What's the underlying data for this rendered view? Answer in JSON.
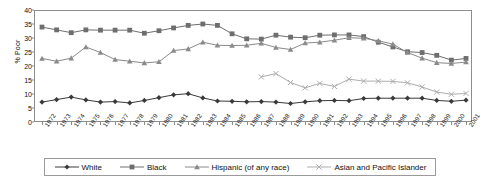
{
  "chart_data": {
    "type": "line",
    "title": "",
    "xlabel": "",
    "ylabel": "% Poor",
    "ylim": [
      0,
      40
    ],
    "ytick_values": [
      0,
      5,
      10,
      15,
      20,
      25,
      30,
      35,
      40
    ],
    "grid": false,
    "legend_position": "bottom",
    "categories": [
      "1972",
      "1973",
      "1974",
      "1975",
      "1976",
      "1977",
      "1978",
      "1979",
      "1980",
      "1981",
      "1982",
      "1983",
      "1984",
      "1985",
      "1986",
      "1987",
      "1988",
      "1989",
      "1990",
      "1991",
      "1992",
      "1993",
      "1994",
      "1995",
      "1996",
      "1997",
      "1998",
      "1999",
      "2000",
      "2001"
    ],
    "series": [
      {
        "name": "White",
        "marker": "diamond",
        "color": "#3a3a3a",
        "values": [
          7.1,
          8.0,
          8.9,
          7.9,
          7.1,
          7.3,
          6.8,
          7.7,
          8.7,
          9.7,
          10.1,
          8.6,
          7.5,
          7.4,
          7.2,
          7.3,
          7.1,
          6.6,
          7.2,
          7.6,
          7.7,
          7.6,
          8.4,
          8.5,
          8.5,
          8.5,
          8.5,
          7.7,
          7.4,
          7.8
        ]
      },
      {
        "name": "Black",
        "marker": "square",
        "color": "#6e6e6e",
        "values": [
          33.9,
          32.9,
          31.9,
          32.9,
          32.8,
          32.8,
          32.8,
          31.7,
          32.6,
          33.6,
          34.5,
          35.0,
          34.5,
          31.5,
          29.7,
          29.6,
          31.0,
          30.3,
          30.1,
          31.0,
          31.1,
          31.1,
          30.5,
          28.5,
          26.8,
          25.1,
          24.8,
          23.8,
          22.1,
          22.7
        ]
      },
      {
        "name": "Hispanic (of any race)",
        "marker": "triangle",
        "color": "#8a8a8a",
        "values": [
          22.7,
          21.7,
          22.8,
          26.8,
          24.8,
          22.3,
          21.7,
          21.1,
          21.5,
          25.5,
          26.1,
          28.5,
          27.4,
          27.3,
          27.4,
          28.1,
          26.6,
          25.9,
          28.2,
          28.5,
          29.2,
          30.1,
          29.9,
          29.0,
          27.8,
          24.8,
          22.8,
          21.2,
          20.9,
          21.4
        ]
      },
      {
        "name": "Asian and Pacific Islander",
        "marker": "x",
        "color": "#adadad",
        "start_year": "1987",
        "values": [
          null,
          null,
          null,
          null,
          null,
          null,
          null,
          null,
          null,
          null,
          null,
          null,
          null,
          null,
          null,
          16.1,
          17.3,
          14.1,
          12.2,
          13.8,
          12.7,
          15.3,
          14.6,
          14.6,
          14.5,
          14.0,
          12.5,
          10.7,
          9.9,
          10.2
        ]
      }
    ]
  },
  "legend": {
    "items": [
      {
        "label": "White"
      },
      {
        "label": "Black"
      },
      {
        "label": "Hispanic (of any race)"
      },
      {
        "label": "Asian and Pacific Islander"
      }
    ]
  }
}
